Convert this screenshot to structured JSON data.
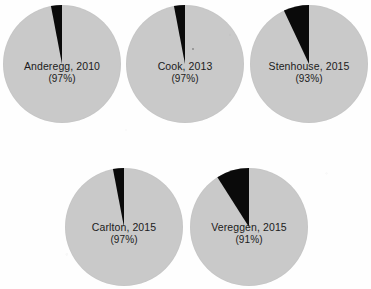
{
  "figure": {
    "background_color": "#fefefe",
    "slice_color_major": "#c9c9c9",
    "slice_color_minor": "#000000"
  },
  "chart_data": [
    {
      "type": "pie",
      "title": "Anderegg, 2010",
      "label_line1": "Anderegg, 2010",
      "label_line2": "(97%)",
      "categories": [
        "Consensus",
        "Non-consensus"
      ],
      "values": [
        97,
        3
      ],
      "colors": [
        "#c9c9c9",
        "#000000"
      ],
      "start_angle_deg": 90,
      "direction": "counterclockwise"
    },
    {
      "type": "pie",
      "title": "Cook, 2013",
      "label_line1": "Cook, 2013",
      "label_line2": "(97%)",
      "categories": [
        "Consensus",
        "Non-consensus"
      ],
      "values": [
        97,
        3
      ],
      "colors": [
        "#c9c9c9",
        "#000000"
      ],
      "start_angle_deg": 90,
      "direction": "counterclockwise"
    },
    {
      "type": "pie",
      "title": "Stenhouse, 2015",
      "label_line1": "Stenhouse, 2015",
      "label_line2": "(93%)",
      "categories": [
        "Consensus",
        "Non-consensus"
      ],
      "values": [
        93,
        7
      ],
      "colors": [
        "#c9c9c9",
        "#000000"
      ],
      "start_angle_deg": 90,
      "direction": "counterclockwise"
    },
    {
      "type": "pie",
      "title": "Carlton, 2015",
      "label_line1": "Carlton, 2015",
      "label_line2": "(97%)",
      "categories": [
        "Consensus",
        "Non-consensus"
      ],
      "values": [
        97,
        3
      ],
      "colors": [
        "#c9c9c9",
        "#000000"
      ],
      "start_angle_deg": 90,
      "direction": "counterclockwise"
    },
    {
      "type": "pie",
      "title": "Vereggen, 2015",
      "label_line1": "Vereggen, 2015",
      "label_line2": "(91%)",
      "categories": [
        "Consensus",
        "Non-consensus"
      ],
      "values": [
        91,
        9
      ],
      "colors": [
        "#c9c9c9",
        "#000000"
      ],
      "start_angle_deg": 90,
      "direction": "counterclockwise"
    }
  ]
}
